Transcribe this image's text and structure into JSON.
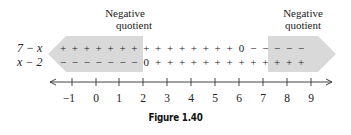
{
  "figure": {
    "caption": "Figure 1.40",
    "annotations": [
      {
        "line1": "Negative",
        "line2": "quotient",
        "side": "left"
      },
      {
        "line1": "Negative",
        "line2": "quotient",
        "side": "right"
      }
    ],
    "rows": [
      {
        "label": "7 − x",
        "signs": [
          "+",
          "+",
          "+",
          "+",
          "+",
          "+",
          "+",
          "+",
          "+",
          "+",
          "+",
          "+",
          "+",
          "+",
          "+",
          "0",
          "−",
          "−",
          "−",
          "−",
          "−"
        ]
      },
      {
        "label": "x − 2",
        "signs": [
          "−",
          "−",
          "−",
          "−",
          "−",
          "−",
          "−",
          "0",
          "+",
          "+",
          "+",
          "+",
          "+",
          "+",
          "+",
          "+",
          "+",
          "+",
          "+",
          "+",
          "+"
        ]
      }
    ],
    "number_line": {
      "ticks": [
        "−1",
        "0",
        "1",
        "2",
        "3",
        "4",
        "5",
        "6",
        "7",
        "8",
        "9"
      ]
    },
    "colors": {
      "shade": "#d9d9d9",
      "line": "#444444"
    }
  }
}
